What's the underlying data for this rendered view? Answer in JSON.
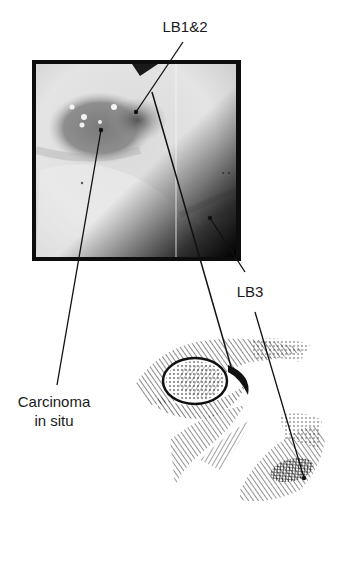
{
  "figure": {
    "labels": {
      "lb12": "LB1&2",
      "lb3": "LB3",
      "carcinoma_line1": "Carcinoma",
      "carcinoma_line2": "in situ"
    },
    "panels": {
      "photo": "bronchoscopic-view",
      "illustration": "bronchial-branch-engraving"
    },
    "colors": {
      "ink": "#111111",
      "frame": "#0d0d0d",
      "photo_light": "#e6e6e6",
      "photo_mid": "#9a9a9a",
      "photo_dark": "#3a3a3a"
    }
  }
}
